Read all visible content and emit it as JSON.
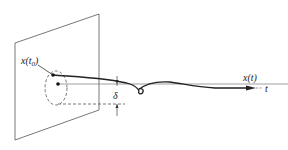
{
  "diagram": {
    "labels": {
      "initial_state": "x(t",
      "initial_sub": "0",
      "initial_close": ")",
      "trajectory": "x(t)",
      "time_axis": "t",
      "delta": "δ"
    },
    "colors": {
      "stroke": "#333333",
      "background": "#ffffff"
    }
  }
}
